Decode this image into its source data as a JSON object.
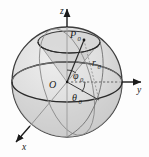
{
  "figure": {
    "name": "spherical-coordinates-diagram",
    "background": "#fdfdfd",
    "sphere": {
      "center_x": 67,
      "center_y": 82,
      "radius": 55,
      "fill": "#dcdcdc",
      "fill_light": "#e8e8e8",
      "fill_dark": "#cfcfcf",
      "stroke": "#3a3a3a"
    },
    "axes": [
      {
        "id": "z",
        "label": "z",
        "direction": "up",
        "label_x": 62,
        "label_y": 11
      },
      {
        "id": "y",
        "label": "y",
        "direction": "right",
        "label_x": 140,
        "label_y": 90
      },
      {
        "id": "x",
        "label": "x",
        "direction": "down-left",
        "label_x": 25,
        "label_y": 147
      }
    ],
    "labels": {
      "origin": "O",
      "point": "P",
      "point_sub": "0",
      "radius": "r",
      "radius_sub": "0",
      "polar_angle": "φ",
      "polar_angle_sub": "0",
      "azimuth_angle": "θ",
      "azimuth_angle_sub": "0"
    },
    "label_positions": {
      "origin": {
        "x": 52,
        "y": 88
      },
      "point": {
        "x": 70,
        "y": 39
      },
      "radius": {
        "x": 95,
        "y": 65
      },
      "polar_angle": {
        "x": 73,
        "y": 78
      },
      "azimuth_angle": {
        "x": 73,
        "y": 100
      }
    }
  }
}
